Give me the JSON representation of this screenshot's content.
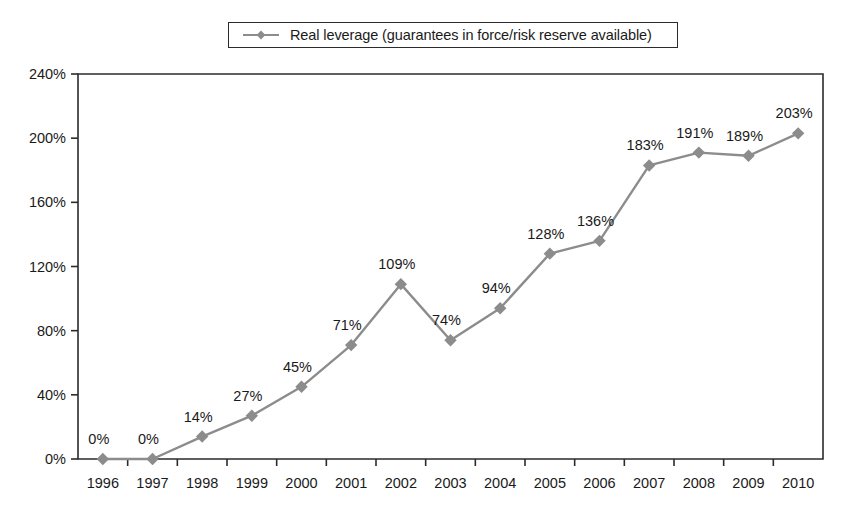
{
  "legend": {
    "entries": [
      {
        "label": "Real leverage (guarantees in force/risk reserve available)",
        "color": "#8c8c8c",
        "marker": "diamond"
      }
    ],
    "position": "top-center",
    "boxed": true
  },
  "chart_data": {
    "type": "line",
    "title": "",
    "subtitle": "",
    "xlabel": "",
    "ylabel": "",
    "categories": [
      "1996",
      "1997",
      "1998",
      "1999",
      "2000",
      "2001",
      "2002",
      "2003",
      "2004",
      "2005",
      "2006",
      "2007",
      "2008",
      "2009",
      "2010"
    ],
    "series": [
      {
        "name": "Real leverage (guarantees in force/risk reserve available)",
        "color": "#8c8c8c",
        "marker": "diamond",
        "values": [
          0,
          0,
          14,
          27,
          45,
          71,
          109,
          74,
          94,
          128,
          136,
          183,
          191,
          189,
          203
        ],
        "point_labels": [
          "0%",
          "0%",
          "14%",
          "27%",
          "45%",
          "71%",
          "109%",
          "74%",
          "94%",
          "128%",
          "136%",
          "183%",
          "191%",
          "189%",
          "203%"
        ]
      }
    ],
    "ylim": [
      0,
      240
    ],
    "yticks": [
      0,
      40,
      80,
      120,
      160,
      200,
      240
    ],
    "ytick_labels": [
      "0%",
      "40%",
      "80%",
      "120%",
      "160%",
      "200%",
      "240%"
    ],
    "grid": false,
    "data_labels_shown": true,
    "axis_color": "#2b2b2b",
    "label_unit": "%"
  },
  "plot_geometry": {
    "left": 78,
    "right": 823,
    "top": 74,
    "bottom": 459
  }
}
